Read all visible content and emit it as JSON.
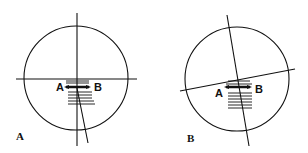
{
  "panels": [
    {
      "id": "A",
      "panel_label": "A",
      "point_a": "A",
      "point_b": "B"
    },
    {
      "id": "B",
      "panel_label": "B",
      "point_a": "A",
      "point_b": "B"
    }
  ],
  "colors": {
    "stroke": "#111111",
    "background": "#ffffff"
  }
}
